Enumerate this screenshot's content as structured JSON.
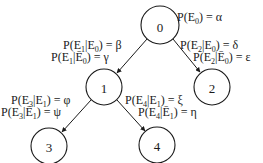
{
  "diagram": {
    "type": "probability-tree",
    "nodes": [
      {
        "id": "0",
        "label": "0",
        "cx": 160,
        "cy": 25,
        "r": 19
      },
      {
        "id": "1",
        "label": "1",
        "cx": 104,
        "cy": 87,
        "r": 18
      },
      {
        "id": "2",
        "label": "2",
        "cx": 212,
        "cy": 87,
        "r": 18
      },
      {
        "id": "3",
        "label": "3",
        "cx": 49,
        "cy": 146,
        "r": 18
      },
      {
        "id": "4",
        "label": "4",
        "cx": 157,
        "cy": 145,
        "r": 18
      }
    ],
    "edges": [
      {
        "from": "0",
        "to": "1"
      },
      {
        "from": "0",
        "to": "2"
      },
      {
        "from": "1",
        "to": "3"
      },
      {
        "from": "1",
        "to": "4"
      }
    ],
    "labels": {
      "root": {
        "prefix": "P(E",
        "sub": "0",
        "suffix": ") = α"
      },
      "e1_given_e0": {
        "prefix": "P(E",
        "sub1": "1",
        "mid": "|E",
        "sub2": "0",
        "suffix": ") = β"
      },
      "e1_given_not_e0": {
        "prefix": "P(E",
        "sub1": "1",
        "mid": "|Ē",
        "sub2": "0",
        "suffix": ") = γ"
      },
      "e2_given_e0": {
        "prefix": "P(E",
        "sub1": "2",
        "mid": "|E",
        "sub2": "0",
        "suffix": ") = δ"
      },
      "e2_given_not_e0": {
        "prefix": "P(E",
        "sub1": "2",
        "mid": "|Ē",
        "sub2": "0",
        "suffix": ") = ε"
      },
      "e3_given_e1": {
        "prefix": "P(E",
        "sub1": "3",
        "mid": "|E",
        "sub2": "1",
        "suffix": ") = φ"
      },
      "e3_given_not_e1": {
        "prefix": "P(E",
        "sub1": "3",
        "mid": "|Ē",
        "sub2": "1",
        "suffix": ") = ψ"
      },
      "e4_given_e1": {
        "prefix": "P(E",
        "sub1": "4",
        "mid": "|E",
        "sub2": "1",
        "suffix": ") = ξ"
      },
      "e4_given_not_e1": {
        "prefix": "P(E",
        "sub1": "4",
        "mid": "|Ē",
        "sub2": "1",
        "suffix": ") = η"
      }
    }
  }
}
